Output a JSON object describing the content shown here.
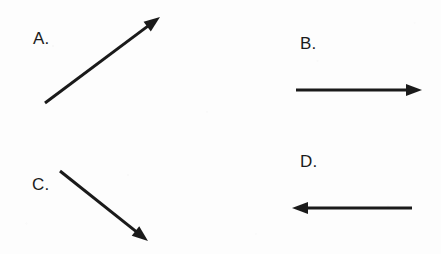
{
  "figure": {
    "width": 441,
    "height": 254,
    "background_color": "#fdfdfd",
    "ink_color": "#1a1a1a",
    "stroke_width": 3
  },
  "items": [
    {
      "id": "a",
      "label": "A.",
      "label_x": 33,
      "label_y": 30,
      "direction": "up-right",
      "tail_x": 45,
      "tail_y": 103,
      "tip_x": 160,
      "tip_y": 17
    },
    {
      "id": "b",
      "label": "B.",
      "label_x": 300,
      "label_y": 35,
      "direction": "right",
      "tail_x": 296,
      "tail_y": 90,
      "tip_x": 422,
      "tip_y": 90
    },
    {
      "id": "c",
      "label": "C.",
      "label_x": 32,
      "label_y": 176,
      "direction": "down-right",
      "tail_x": 60,
      "tail_y": 171,
      "tip_x": 148,
      "tip_y": 241
    },
    {
      "id": "d",
      "label": "D.",
      "label_x": 300,
      "label_y": 153,
      "direction": "left",
      "tail_x": 412,
      "tail_y": 208,
      "tip_x": 292,
      "tip_y": 208
    }
  ]
}
